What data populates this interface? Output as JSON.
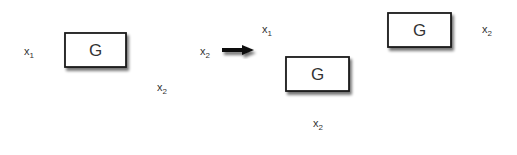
{
  "diagram": {
    "type": "block-diagram-equivalence",
    "left": {
      "block": {
        "label": "G"
      },
      "input": {
        "label": "x",
        "sub": "1"
      },
      "output": {
        "label": "x",
        "sub": "2"
      },
      "branch_output": {
        "label": "x",
        "sub": "2"
      }
    },
    "transform_arrow": "equivalent-to",
    "right": {
      "main_block": {
        "label": "G"
      },
      "feed_block": {
        "label": "G"
      },
      "input": {
        "label": "x",
        "sub": "1"
      },
      "output": {
        "label": "x",
        "sub": "2"
      },
      "feed_input": {
        "label": "x",
        "sub": "2"
      }
    },
    "colors": {
      "line": "#1a1a1a",
      "text": "#333333",
      "box_fill": "#ffffff",
      "shadow": "#9a9a9a"
    }
  }
}
